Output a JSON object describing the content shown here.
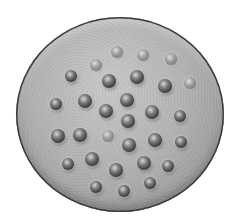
{
  "image": {
    "subject": "circular disc with raised bosses",
    "palette": {
      "background": "#ffffff",
      "disc_light": "#c9c9c9",
      "disc_dark": "#8a8a8a",
      "rim": "#3a3a3a",
      "boss_dark": "#3e3e3e"
    },
    "disc": {
      "cx": 120,
      "cy": 114,
      "rx": 104,
      "ry": 97
    },
    "bosses": [
      {
        "x": 117,
        "y": 52,
        "r": 6,
        "faint": true
      },
      {
        "x": 143,
        "y": 55,
        "r": 6,
        "faint": true
      },
      {
        "x": 171,
        "y": 59,
        "r": 6,
        "faint": true
      },
      {
        "x": 96,
        "y": 65,
        "r": 6,
        "faint": true
      },
      {
        "x": 71,
        "y": 76,
        "r": 6,
        "faint": false
      },
      {
        "x": 137,
        "y": 77,
        "r": 7,
        "faint": false
      },
      {
        "x": 109,
        "y": 81,
        "r": 7,
        "faint": false
      },
      {
        "x": 165,
        "y": 86,
        "r": 7,
        "faint": false
      },
      {
        "x": 190,
        "y": 83,
        "r": 6,
        "faint": true
      },
      {
        "x": 56,
        "y": 104,
        "r": 6,
        "faint": false
      },
      {
        "x": 85,
        "y": 101,
        "r": 7,
        "faint": false
      },
      {
        "x": 127,
        "y": 100,
        "r": 7,
        "faint": false
      },
      {
        "x": 106,
        "y": 111,
        "r": 7,
        "faint": false
      },
      {
        "x": 152,
        "y": 112,
        "r": 7,
        "faint": false
      },
      {
        "x": 180,
        "y": 116,
        "r": 6,
        "faint": false
      },
      {
        "x": 128,
        "y": 121,
        "r": 7,
        "faint": false
      },
      {
        "x": 58,
        "y": 136,
        "r": 7,
        "faint": false
      },
      {
        "x": 80,
        "y": 135,
        "r": 7,
        "faint": false
      },
      {
        "x": 108,
        "y": 136,
        "r": 6,
        "faint": true
      },
      {
        "x": 155,
        "y": 140,
        "r": 7,
        "faint": false
      },
      {
        "x": 181,
        "y": 142,
        "r": 6,
        "faint": false
      },
      {
        "x": 129,
        "y": 145,
        "r": 7,
        "faint": false
      },
      {
        "x": 92,
        "y": 159,
        "r": 7,
        "faint": false
      },
      {
        "x": 68,
        "y": 164,
        "r": 6,
        "faint": false
      },
      {
        "x": 144,
        "y": 163,
        "r": 7,
        "faint": false
      },
      {
        "x": 168,
        "y": 166,
        "r": 6,
        "faint": false
      },
      {
        "x": 116,
        "y": 170,
        "r": 7,
        "faint": false
      },
      {
        "x": 96,
        "y": 187,
        "r": 6,
        "faint": false
      },
      {
        "x": 124,
        "y": 191,
        "r": 6,
        "faint": false
      },
      {
        "x": 150,
        "y": 183,
        "r": 6,
        "faint": false
      }
    ]
  }
}
